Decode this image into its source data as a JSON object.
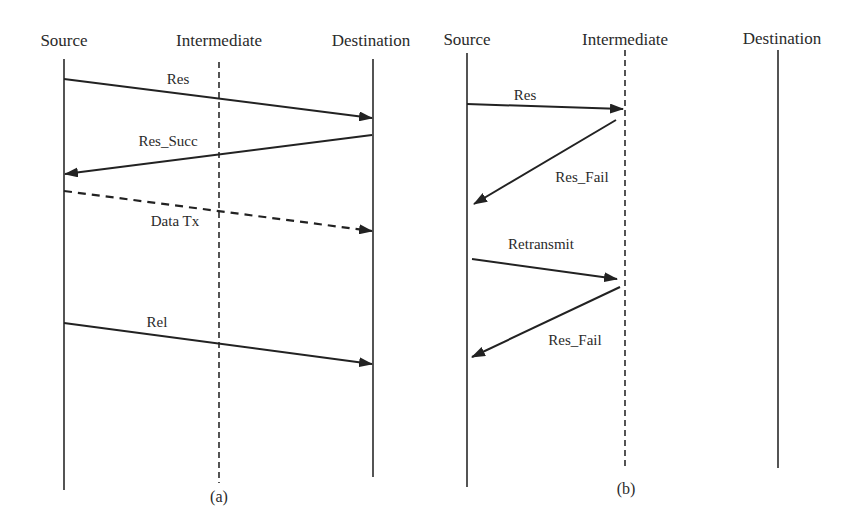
{
  "panels": [
    {
      "caption": "(a)",
      "participants": [
        {
          "name": "Source",
          "line_style": "solid"
        },
        {
          "name": "Intermediate",
          "line_style": "dashed"
        },
        {
          "name": "Destination",
          "line_style": "solid"
        }
      ],
      "messages": [
        {
          "label": "Res",
          "from": "Source",
          "to": "Destination",
          "style": "solid"
        },
        {
          "label": "Res_Succ",
          "from": "Destination",
          "to": "Source",
          "style": "solid"
        },
        {
          "label": "Data Tx",
          "from": "Source",
          "to": "Destination",
          "style": "dashed"
        },
        {
          "label": "Rel",
          "from": "Source",
          "to": "Destination",
          "style": "solid"
        }
      ]
    },
    {
      "caption": "(b)",
      "participants": [
        {
          "name": "Source",
          "line_style": "solid"
        },
        {
          "name": "Intermediate",
          "line_style": "dashed"
        },
        {
          "name": "Destination",
          "line_style": "solid"
        }
      ],
      "messages": [
        {
          "label": "Res",
          "from": "Source",
          "to": "Intermediate",
          "style": "solid"
        },
        {
          "label": "Res_Fail",
          "from": "Intermediate",
          "to": "Source",
          "style": "solid"
        },
        {
          "label": "Retransmit",
          "from": "Source",
          "to": "Intermediate",
          "style": "solid"
        },
        {
          "label": "Res_Fail",
          "from": "Intermediate",
          "to": "Source",
          "style": "solid"
        }
      ]
    }
  ],
  "colors": {
    "line": "#222222",
    "text": "#2a2a2a",
    "background": "#ffffff"
  }
}
